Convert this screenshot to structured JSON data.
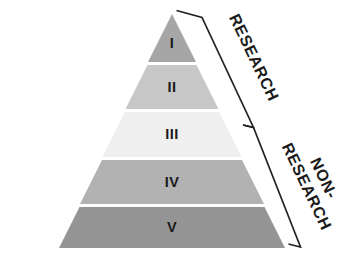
{
  "diagram": {
    "type": "pyramid",
    "background_color": "#ffffff",
    "numeral_color": "#1a1a1a",
    "bracket_color": "#222222",
    "tier_gap_color": "#ffffff"
  },
  "tiers": [
    {
      "numeral": "I",
      "level": 1,
      "color": "#a6a6a6",
      "group": "RESEARCH"
    },
    {
      "numeral": "II",
      "level": 2,
      "color": "#c7c7c7",
      "group": "RESEARCH"
    },
    {
      "numeral": "III",
      "level": 3,
      "color": "#efefef",
      "group": "RESEARCH"
    },
    {
      "numeral": "IV",
      "level": 4,
      "color": "#b2b2b2",
      "group": "NON-RESEARCH"
    },
    {
      "numeral": "V",
      "level": 5,
      "color": "#949494",
      "group": "NON-RESEARCH"
    }
  ],
  "brackets": [
    {
      "id": "research",
      "label": "RESEARCH",
      "label_lines": [
        "RESEARCH"
      ],
      "covers_tiers": [
        "I",
        "II",
        "III"
      ]
    },
    {
      "id": "non-research",
      "label": "NON-RESEARCH",
      "label_lines": [
        "NON-",
        "RESEARCH"
      ],
      "covers_tiers": [
        "IV",
        "V"
      ]
    }
  ]
}
